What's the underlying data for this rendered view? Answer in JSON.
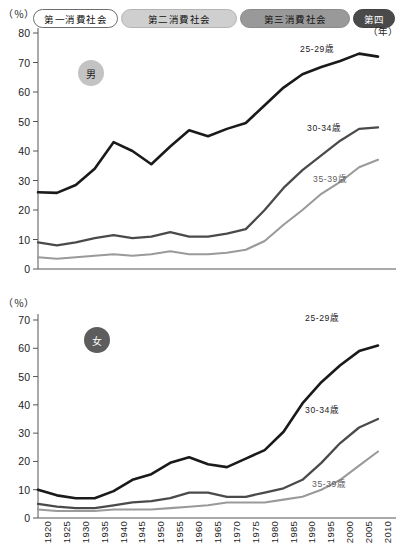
{
  "header": {
    "eras": [
      {
        "name": "era-first",
        "label": "第一消費社会"
      },
      {
        "name": "era-second",
        "label": "第二消費社会"
      },
      {
        "name": "era-third",
        "label": "第三消費社会"
      },
      {
        "name": "era-fourth",
        "label": "第四"
      }
    ]
  },
  "axis_unit_top": "（％）",
  "axis_unit_bottom": "（％）",
  "x_unit": "（年）",
  "badges": {
    "male": "男",
    "female": "女"
  },
  "colors": {
    "series_25_29": "#1a1a1a",
    "series_30_34": "#4a4a4a",
    "series_35_39": "#9a9a9a",
    "era_1_bg": "#ffffff",
    "era_2_bg": "#cfcfcf",
    "era_3_bg": "#999999",
    "era_4_bg": "#4a4a4a",
    "badge_male_bg": "#c3c3c3",
    "badge_female_bg": "#5d5d5d",
    "axis": "#555555"
  },
  "chart_data": [
    {
      "type": "line",
      "name": "male-unmarried-rate",
      "title": "男",
      "xlabel": "（年）",
      "ylabel": "（％）",
      "xlim": [
        1920,
        2010
      ],
      "ylim": [
        0,
        80
      ],
      "yticks": [
        0,
        10,
        20,
        30,
        40,
        50,
        60,
        70,
        80
      ],
      "grid": false,
      "legend_position": "inline-right",
      "x": [
        1920,
        1925,
        1930,
        1935,
        1940,
        1945,
        1950,
        1955,
        1960,
        1965,
        1970,
        1975,
        1980,
        1985,
        1990,
        1995,
        2000,
        2005,
        2010
      ],
      "series": [
        {
          "name": "25-29歳",
          "label": "25-29歳",
          "color": "#1a1a1a",
          "values": [
            26.0,
            25.8,
            28.5,
            34.0,
            43.0,
            40.0,
            35.5,
            41.5,
            47.0,
            45.0,
            47.5,
            49.5,
            55.5,
            61.5,
            66.0,
            68.5,
            70.5,
            73.0,
            72.0
          ]
        },
        {
          "name": "30-34歳",
          "label": "30-34歳",
          "color": "#4a4a4a",
          "values": [
            9.0,
            8.0,
            9.0,
            10.5,
            11.5,
            10.5,
            11.0,
            12.5,
            11.0,
            11.0,
            12.0,
            13.5,
            20.0,
            27.5,
            33.5,
            38.5,
            43.5,
            47.5,
            48.0
          ]
        },
        {
          "name": "35-39歳",
          "label": "35-39歳",
          "color": "#9a9a9a",
          "values": [
            4.0,
            3.5,
            4.0,
            4.5,
            5.0,
            4.5,
            5.0,
            6.0,
            5.0,
            5.0,
            5.5,
            6.5,
            9.5,
            15.0,
            20.0,
            25.5,
            29.5,
            34.5,
            37.0
          ]
        }
      ]
    },
    {
      "type": "line",
      "name": "female-unmarried-rate",
      "title": "女",
      "xlabel": "（年）",
      "ylabel": "（％）",
      "xlim": [
        1920,
        2010
      ],
      "ylim": [
        0,
        70
      ],
      "yticks": [
        0,
        10,
        20,
        30,
        40,
        50,
        60,
        70
      ],
      "grid": false,
      "legend_position": "inline-right",
      "x": [
        1920,
        1925,
        1930,
        1935,
        1940,
        1945,
        1950,
        1955,
        1960,
        1965,
        1970,
        1975,
        1980,
        1985,
        1990,
        1995,
        2000,
        2005,
        2010
      ],
      "series": [
        {
          "name": "25-29歳",
          "label": "25-29歳",
          "color": "#1a1a1a",
          "values": [
            10.0,
            8.0,
            7.0,
            7.0,
            9.5,
            13.5,
            15.5,
            19.5,
            21.5,
            19.0,
            18.0,
            21.0,
            24.0,
            30.5,
            40.5,
            48.0,
            54.0,
            59.0,
            61.0
          ]
        },
        {
          "name": "30-34歳",
          "label": "30-34歳",
          "color": "#4a4a4a",
          "values": [
            5.0,
            4.0,
            3.5,
            3.5,
            4.5,
            5.5,
            6.0,
            7.0,
            9.0,
            9.0,
            7.5,
            7.5,
            9.0,
            10.5,
            13.5,
            19.5,
            26.5,
            32.0,
            35.0
          ]
        },
        {
          "name": "35-39歳",
          "label": "35-39歳",
          "color": "#9a9a9a",
          "values": [
            3.0,
            2.5,
            2.5,
            2.5,
            3.0,
            3.0,
            3.0,
            3.5,
            4.0,
            4.5,
            5.5,
            5.5,
            5.5,
            6.5,
            7.5,
            10.0,
            13.5,
            18.5,
            23.5
          ]
        }
      ]
    }
  ],
  "xtick_labels": [
    "1920",
    "1925",
    "1930",
    "1935",
    "1940",
    "1945",
    "1950",
    "1955",
    "1960",
    "1965",
    "1970",
    "1975",
    "1980",
    "1985",
    "1990",
    "1995",
    "2000",
    "2005",
    "2010"
  ]
}
